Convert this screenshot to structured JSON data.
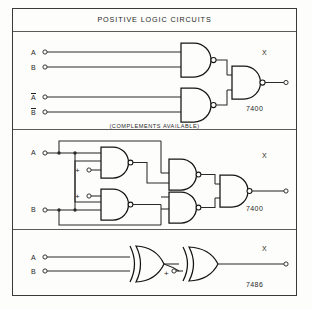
{
  "diagram": {
    "title": "POSITIVE LOGIC CIRCUITS",
    "note": "(COMPLEMENTS AVAILABLE)",
    "panels": [
      {
        "id": "nand-complements",
        "part_number": "7400",
        "gate_type": "NAND",
        "gate_count": 3,
        "inputs": [
          {
            "label": "A",
            "overbar": false
          },
          {
            "label": "B",
            "overbar": false
          },
          {
            "label": "A",
            "overbar": true
          },
          {
            "label": "B",
            "overbar": true
          }
        ],
        "outputs": [
          {
            "label": "X"
          }
        ]
      },
      {
        "id": "nand-four-gate",
        "part_number": "7400",
        "gate_type": "NAND",
        "gate_count": 5,
        "inputs": [
          {
            "label": "A",
            "overbar": false
          },
          {
            "label": "B",
            "overbar": false
          }
        ],
        "supply_terminals": [
          "+",
          "+"
        ],
        "outputs": [
          {
            "label": "X"
          }
        ]
      },
      {
        "id": "xor-pair",
        "part_number": "7486",
        "gate_type": "XOR",
        "gate_count": 2,
        "inputs": [
          {
            "label": "A",
            "overbar": false
          },
          {
            "label": "B",
            "overbar": false
          }
        ],
        "supply_terminals": [
          "+"
        ],
        "outputs": [
          {
            "label": "X"
          }
        ]
      }
    ],
    "colors": {
      "background": "#fdfdfb",
      "line": "#2a2a2a",
      "gate_outline": "#141414",
      "frame": "#3a3a3a"
    }
  }
}
